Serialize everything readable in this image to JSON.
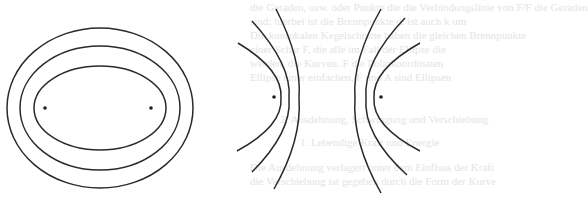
{
  "figure": {
    "stroke_color": "#2a2a2a",
    "focus_color": "#1e1e1e",
    "background": "#ffffff"
  },
  "ellipses": {
    "center": [
      100,
      108
    ],
    "foci": [
      [
        45,
        108
      ],
      [
        151,
        108
      ]
    ],
    "items": [
      {
        "name": "outer",
        "rx": 93,
        "ry": 80
      },
      {
        "name": "middle",
        "rx": 80,
        "ry": 62
      },
      {
        "name": "inner",
        "rx": 66,
        "ry": 42
      }
    ]
  },
  "hyperbolas": {
    "foci": [
      [
        274,
        97
      ],
      [
        381,
        97
      ]
    ],
    "left_branches": [
      {
        "name": "left-outer",
        "path": "M238,43 Q283,70 281,98 Q283,126 237,151"
      },
      {
        "name": "left-middle",
        "path": "M252,21 Q292,65 289,98 Q292,132 252,172"
      },
      {
        "name": "left-inner",
        "path": "M276,9 Q302,60 299,98 Q302,140 274,189"
      }
    ],
    "right_branches": [
      {
        "name": "right-outer",
        "path": "M420,43 Q372,70 374,98 Q372,126 420,151"
      },
      {
        "name": "right-middle",
        "path": "M405,18 Q363,62 366,98 Q363,135 407,175"
      },
      {
        "name": "right-inner",
        "path": "M381,9 Q352,60 355,98 Q352,142 381,193"
      }
    ]
  },
  "background_text": {
    "lines": [
      "die Geraden, usw. oder Punkte die die Verbindungslinie von F/F die Geraden",
      "sind; hierbei ist die Brennpunkte d. ist auch k um",
      "Die konfokalen Kegelschnitte haben die gleichen Brennpunkte",
      "einer Schar F, die alle im Fall der Ellipse die",
      "werden, die Kurven. F die Polarkoordinaten",
      "Ellipse einer einfachen, F und A sind Ellipsen",
      "2. Ausdehnung, Schwingung und Verschiebung",
      "1. Lebendige Kraft und Energie",
      "Die Ausdehnung verlagert unter dem Einfluss der Kraft",
      "die Verschiebung ist gegeben durch die Form der Kurve"
    ]
  }
}
